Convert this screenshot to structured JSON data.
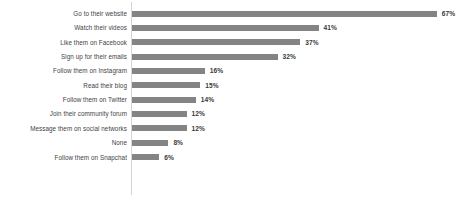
{
  "chart_data": {
    "type": "bar",
    "orientation": "horizontal",
    "title": "",
    "subtitle": "",
    "xlabel": "",
    "ylabel": "",
    "grid": false,
    "legend": false,
    "legend_position": "none",
    "axis_color": "#d6d6d6",
    "bar_color": "#848484",
    "label_color": "#3f3f3f",
    "value_label_color": "#3a3a3a",
    "value_suffix": "%",
    "xlim": [
      0,
      67
    ],
    "categories": [
      "Go to their website",
      "Watch their videos",
      "Like them on Facebook",
      "Sign up for their emails",
      "Follow them on Instagram",
      "Read their blog",
      "Follow them on Twitter",
      "Join their community forum",
      "Message them on social networks",
      "None",
      "Follow them on Snapchat"
    ],
    "values": [
      67,
      41,
      37,
      32,
      16,
      15,
      14,
      12,
      12,
      8,
      6
    ],
    "value_labels": [
      "67%",
      "41%",
      "37%",
      "32%",
      "16%",
      "15%",
      "14%",
      "12%",
      "12%",
      "8%",
      "6%"
    ]
  }
}
